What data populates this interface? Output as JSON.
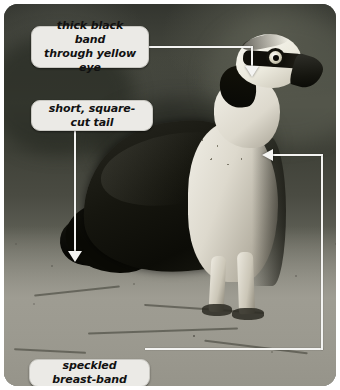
{
  "figure": {
    "photo_style": "grayscale photograph",
    "frame_corner_radius_px": 14,
    "width_px": 340,
    "height_px": 390
  },
  "callouts": [
    {
      "id": "eye",
      "text": "thick black band\nthrough yellow eye",
      "line1": "thick black band",
      "line2": "through yellow eye",
      "points_to": "head eye stripe",
      "arrow_direction": "down"
    },
    {
      "id": "tail",
      "text": "short, square-cut tail",
      "points_to": "tail",
      "arrow_direction": "down"
    },
    {
      "id": "breast",
      "text": "speckled breast-band",
      "points_to": "upper breast",
      "arrow_direction": "left"
    }
  ],
  "colors": {
    "label_background": "#ebeae6",
    "label_border": "#c9c8c2",
    "label_text": "#111111",
    "leader_line": "#f4f4f2",
    "photo_background_top": "#33352f",
    "photo_ground": "#9c9b91"
  }
}
